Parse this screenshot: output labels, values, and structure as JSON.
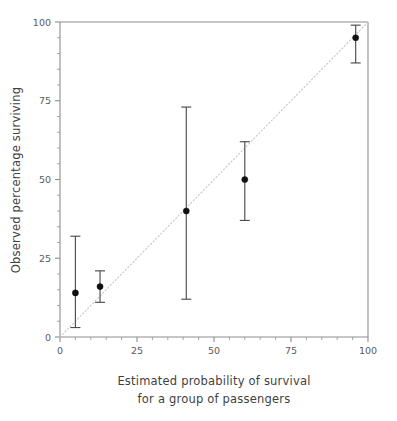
{
  "chart_data": {
    "type": "scatter",
    "title": "",
    "subtitle": "",
    "xlabel": "Estimated probability of survival for a group of passengers",
    "xlabel_line1": "Estimated probability of survival",
    "xlabel_line2": "for a group of passengers",
    "ylabel": "Observed percentage surviving",
    "xlim": [
      0,
      100
    ],
    "ylim": [
      0,
      100
    ],
    "xticks": [
      0,
      25,
      50,
      75,
      100
    ],
    "yticks": [
      0,
      25,
      50,
      75,
      100
    ],
    "xticklabels": [
      "0",
      "25",
      "50",
      "75",
      "100"
    ],
    "yticklabels": [
      "0",
      "25",
      "50",
      "75",
      "100"
    ],
    "x_minor_ticks": [
      5,
      10,
      15,
      20,
      30,
      35,
      40,
      45,
      55,
      60,
      65,
      70,
      80,
      85,
      90,
      95
    ],
    "y_minor_ticks": [
      5,
      10,
      15,
      20,
      30,
      35,
      40,
      45,
      55,
      60,
      65,
      70,
      80,
      85,
      90,
      95
    ],
    "grid": false,
    "legend": null,
    "reference_line": {
      "name": "identity-line",
      "style": "dotted",
      "from": [
        0,
        0
      ],
      "to": [
        100,
        100
      ],
      "color": "#c9c3bd"
    },
    "series": [
      {
        "name": "Observed vs estimated survival",
        "marker": "filled-circle",
        "color": "#111111",
        "error_bar_color": "#4c4c4c",
        "points": [
          {
            "label": "group-1",
            "x": 5,
            "y": 14,
            "y_low": 3,
            "y_high": 32
          },
          {
            "label": "group-2",
            "x": 13,
            "y": 16,
            "y_low": 11,
            "y_high": 21
          },
          {
            "label": "group-3",
            "x": 41,
            "y": 40,
            "y_low": 12,
            "y_high": 73
          },
          {
            "label": "group-4",
            "x": 60,
            "y": 50,
            "y_low": 37,
            "y_high": 62
          },
          {
            "label": "group-5",
            "x": 96,
            "y": 95,
            "y_low": 87,
            "y_high": 99
          }
        ]
      }
    ],
    "colors": {
      "axis": "#8d8d8d",
      "tick_label": "#5a5a5a",
      "axis_label": "#3f3f3f",
      "marker": "#111111",
      "error_bar": "#4c4c4c",
      "reference_line": "#c9c3bd",
      "background": "#ffffff"
    }
  }
}
